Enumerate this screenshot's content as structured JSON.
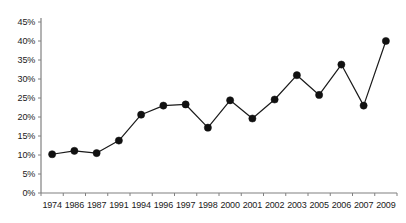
{
  "chart_data": {
    "type": "line",
    "title": "",
    "subtitle": "",
    "xlabel": "",
    "ylabel": "",
    "categories": [
      "1974",
      "1986",
      "1987",
      "1991",
      "1994",
      "1996",
      "1997",
      "1998",
      "2000",
      "2001",
      "2002",
      "2003",
      "2005",
      "2006",
      "2007",
      "2009"
    ],
    "series": [
      {
        "name": "",
        "values": [
          10.2,
          11.1,
          10.5,
          13.8,
          20.6,
          23.0,
          23.3,
          17.2,
          24.4,
          19.6,
          24.6,
          31.0,
          25.8,
          33.8,
          23.0,
          40.0
        ]
      }
    ],
    "ylim": [
      0,
      45
    ],
    "ytick_values": [
      0,
      5,
      10,
      15,
      20,
      25,
      30,
      35,
      40,
      45
    ],
    "ytick_labels": [
      "0%",
      "5%",
      "10%",
      "15%",
      "20%",
      "25%",
      "30%",
      "35%",
      "40%",
      "45%"
    ],
    "grid": false,
    "legend": false,
    "legend_position": "none",
    "line_color": "#1a1a1a",
    "marker_color": "#111111",
    "marker_shape": "circle",
    "axis_color": "#808080",
    "background_color": "#ffffff"
  }
}
